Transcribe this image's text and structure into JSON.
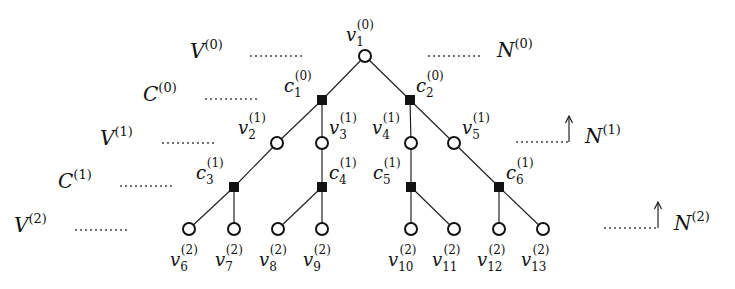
{
  "diagram": {
    "type": "tanner-tree",
    "levels": {
      "V0": {
        "base": "V",
        "sup": "(0)"
      },
      "C0": {
        "base": "C",
        "sup": "(0)"
      },
      "V1": {
        "base": "V",
        "sup": "(1)"
      },
      "C1": {
        "base": "C",
        "sup": "(1)"
      },
      "V2": {
        "base": "V",
        "sup": "(2)"
      }
    },
    "neighborhoods": {
      "N0": {
        "base": "N",
        "sup": "(0)"
      },
      "N1": {
        "base": "N",
        "sup": "(1)"
      },
      "N2": {
        "base": "N",
        "sup": "(2)"
      }
    },
    "nodes": {
      "v1": {
        "base": "v",
        "sub": "1",
        "sup": "(0)"
      },
      "c1": {
        "base": "c",
        "sub": "1",
        "sup": "(0)"
      },
      "c2": {
        "base": "c",
        "sub": "2",
        "sup": "(0)"
      },
      "v2": {
        "base": "v",
        "sub": "2",
        "sup": "(1)"
      },
      "v3": {
        "base": "v",
        "sub": "3",
        "sup": "(1)"
      },
      "v4": {
        "base": "v",
        "sub": "4",
        "sup": "(1)"
      },
      "v5": {
        "base": "v",
        "sub": "5",
        "sup": "(1)"
      },
      "c3": {
        "base": "c",
        "sub": "3",
        "sup": "(1)"
      },
      "c4": {
        "base": "c",
        "sub": "4",
        "sup": "(1)"
      },
      "c5": {
        "base": "c",
        "sub": "5",
        "sup": "(1)"
      },
      "c6": {
        "base": "c",
        "sub": "6",
        "sup": "(1)"
      },
      "v6": {
        "base": "v",
        "sub": "6",
        "sup": "(2)"
      },
      "v7": {
        "base": "v",
        "sub": "7",
        "sup": "(2)"
      },
      "v8": {
        "base": "v",
        "sub": "8",
        "sup": "(2)"
      },
      "v9": {
        "base": "v",
        "sub": "9",
        "sup": "(2)"
      },
      "v10": {
        "base": "v",
        "sub": "10",
        "sup": "(2)"
      },
      "v11": {
        "base": "v",
        "sub": "11",
        "sup": "(2)"
      },
      "v12": {
        "base": "v",
        "sub": "12",
        "sup": "(2)"
      },
      "v13": {
        "base": "v",
        "sub": "13",
        "sup": "(2)"
      }
    },
    "edges": [
      [
        "v1",
        "c1"
      ],
      [
        "v1",
        "c2"
      ],
      [
        "c1",
        "v2"
      ],
      [
        "c1",
        "v3"
      ],
      [
        "c2",
        "v4"
      ],
      [
        "c2",
        "v5"
      ],
      [
        "v2",
        "c3"
      ],
      [
        "v3",
        "c4"
      ],
      [
        "v4",
        "c5"
      ],
      [
        "v5",
        "c6"
      ],
      [
        "c3",
        "v6"
      ],
      [
        "c3",
        "v7"
      ],
      [
        "c4",
        "v8"
      ],
      [
        "c4",
        "v9"
      ],
      [
        "c5",
        "v10"
      ],
      [
        "c5",
        "v11"
      ],
      [
        "c6",
        "v12"
      ],
      [
        "c6",
        "v13"
      ]
    ]
  }
}
